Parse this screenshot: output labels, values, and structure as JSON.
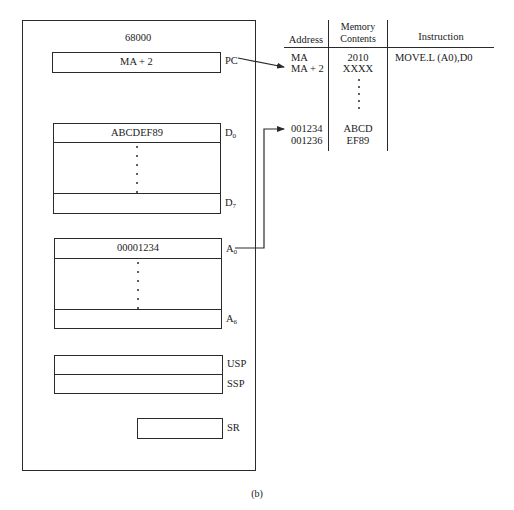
{
  "cpu": {
    "title": "68000",
    "registers": {
      "pc": {
        "label": "PC",
        "value": "MA + 2"
      },
      "data": {
        "first": {
          "label_main": "D",
          "label_sub": "0",
          "value": "ABCDEF89"
        },
        "last": {
          "label_main": "D",
          "label_sub": "7",
          "value": ""
        }
      },
      "address": {
        "first": {
          "label_main": "A",
          "label_sub": "0",
          "value": "00001234"
        },
        "last": {
          "label_main": "A",
          "label_sub": "6",
          "value": ""
        }
      },
      "usp": {
        "label": "USP",
        "value": ""
      },
      "ssp": {
        "label": "SSP",
        "value": ""
      },
      "sr": {
        "label": "SR",
        "value": ""
      }
    }
  },
  "memory_table": {
    "headers": {
      "address": "Address",
      "contents_line1": "Memory",
      "contents_line2": "Contents",
      "instruction": "Instruction"
    },
    "rows": [
      {
        "address": "MA",
        "contents": "2010",
        "instruction": "MOVE.L (A0),D0"
      },
      {
        "address": "MA + 2",
        "contents": "XXXX",
        "instruction": ""
      },
      {
        "address": "001234",
        "contents": "ABCD",
        "instruction": ""
      },
      {
        "address": "001236",
        "contents": "EF89",
        "instruction": ""
      }
    ]
  },
  "arrows": [
    {
      "from": "PC",
      "to": "MA + 2"
    },
    {
      "from": "A0",
      "to": "001234"
    }
  ],
  "caption": "(b)"
}
